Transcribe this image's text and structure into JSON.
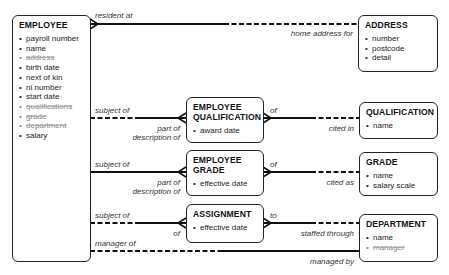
{
  "entities": {
    "employee": {
      "title": "EMPLOYEE",
      "attributes": [
        {
          "name": "payroll number",
          "struck": false
        },
        {
          "name": "name",
          "struck": false
        },
        {
          "name": "address",
          "struck": true
        },
        {
          "name": "birth date",
          "struck": false
        },
        {
          "name": "next of kin",
          "struck": false
        },
        {
          "name": "ni number",
          "struck": false
        },
        {
          "name": "start date",
          "struck": false
        },
        {
          "name": "qualifications",
          "struck": true
        },
        {
          "name": "grade",
          "struck": true
        },
        {
          "name": "department",
          "struck": true
        },
        {
          "name": "salary",
          "struck": false
        }
      ]
    },
    "address": {
      "title": "ADDRESS",
      "attributes": [
        {
          "name": "number"
        },
        {
          "name": "postcode"
        },
        {
          "name": "detail"
        }
      ]
    },
    "employee_qualification": {
      "title_line1": "EMPLOYEE",
      "title_line2": "QUALIFICATION",
      "attributes": [
        {
          "name": "award date"
        }
      ]
    },
    "qualification": {
      "title": "QUALIFICATION",
      "attributes": [
        {
          "name": "name"
        }
      ]
    },
    "employee_grade": {
      "title_line1": "EMPLOYEE",
      "title_line2": "GRADE",
      "attributes": [
        {
          "name": "effective date"
        }
      ]
    },
    "grade": {
      "title": "GRADE",
      "attributes": [
        {
          "name": "name"
        },
        {
          "name": "salary scale"
        }
      ]
    },
    "assignment": {
      "title": "ASSIGNMENT",
      "attributes": [
        {
          "name": "effective date"
        }
      ]
    },
    "department": {
      "title": "DEPARTMENT",
      "attributes": [
        {
          "name": "name",
          "struck": false
        },
        {
          "name": "manager",
          "struck": true
        }
      ]
    }
  },
  "relationships": {
    "resident": {
      "from_label": "resident at",
      "to_label": "home address for"
    },
    "emp_qual_left": {
      "top_label": "subject of",
      "bottom_label_1": "part of",
      "bottom_label_2": "description of"
    },
    "emp_qual_right": {
      "top_label": "of",
      "bottom_label": "cited in"
    },
    "emp_grade_left": {
      "top_label": "subject of",
      "bottom_label_1": "part of",
      "bottom_label_2": "description of"
    },
    "emp_grade_right": {
      "top_label": "of",
      "bottom_label": "cited as"
    },
    "assignment_left": {
      "top_label": "subject of",
      "bottom_label": "of"
    },
    "assignment_right": {
      "top_label": "to",
      "bottom_label": "staffed through"
    },
    "manager": {
      "from_label": "manager of",
      "to_label": "managed by"
    }
  }
}
